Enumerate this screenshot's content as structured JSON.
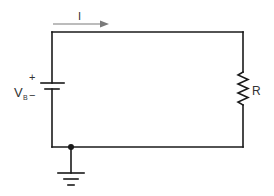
{
  "diagram": {
    "type": "circuit",
    "colors": {
      "wire": "#1a1a1a",
      "current_arrow": "#7a7a7a",
      "label": "#333333",
      "background": "#ffffff"
    },
    "current": {
      "label": "I",
      "direction": "right"
    },
    "battery": {
      "label_main": "V",
      "label_sub": "B",
      "positive_sign": "+",
      "negative_sign": "−"
    },
    "resistor": {
      "label": "R"
    },
    "ground": {
      "node": "bottom-left junction"
    }
  }
}
